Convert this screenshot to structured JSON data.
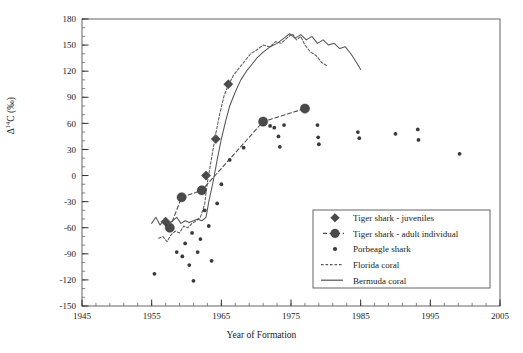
{
  "chart_data": {
    "type": "scatter",
    "title": "",
    "xlabel": "Year of Formation",
    "ylabel": "Δ¹⁴C (‰)",
    "ylabel_parts": {
      "delta": "Δ",
      "sup": "14",
      "c": "C (‰)"
    },
    "xlim": [
      1945,
      2005
    ],
    "ylim": [
      -150,
      180
    ],
    "xticks": [
      1945,
      1955,
      1965,
      1975,
      1985,
      1995,
      2005
    ],
    "xtick_labels": [
      "1945",
      "1955",
      "1965",
      "1975",
      "1985",
      "1995",
      "2005"
    ],
    "x_minor_step": 2,
    "yticks": [
      -150,
      -120,
      -90,
      -60,
      -30,
      0,
      30,
      60,
      90,
      120,
      150,
      180
    ],
    "ytick_labels": [
      "-150",
      "-120",
      "-90",
      "-60",
      "-30",
      "0",
      "30",
      "60",
      "90",
      "120",
      "150",
      "180"
    ],
    "y_minor_step": 10,
    "grid": false,
    "legend_position": "lower right",
    "series": [
      {
        "name": "Tiger shark - juveniles",
        "marker": "diamond",
        "color": "#4a4a4a",
        "line": "none",
        "points": [
          {
            "x": 1957.0,
            "y": -53
          },
          {
            "x": 1962.8,
            "y": 0
          },
          {
            "x": 1964.2,
            "y": 42
          },
          {
            "x": 1966.0,
            "y": 105
          }
        ]
      },
      {
        "name": "Tiger shark - adult individual",
        "marker": "circle",
        "color": "#4a4a4a",
        "line": "dashed",
        "points": [
          {
            "x": 1957.6,
            "y": -60
          },
          {
            "x": 1959.3,
            "y": -25
          },
          {
            "x": 1962.2,
            "y": -17
          },
          {
            "x": 1971.0,
            "y": 62
          },
          {
            "x": 1977.0,
            "y": 77
          }
        ]
      },
      {
        "name": "Porbeagle shark",
        "marker": "small-dot",
        "color": "#3a3a3a",
        "line": "none",
        "points": [
          {
            "x": 1955.4,
            "y": -113
          },
          {
            "x": 1958.6,
            "y": -88
          },
          {
            "x": 1959.4,
            "y": -93
          },
          {
            "x": 1959.8,
            "y": -78
          },
          {
            "x": 1960.4,
            "y": -103
          },
          {
            "x": 1960.8,
            "y": -66
          },
          {
            "x": 1961.0,
            "y": -121
          },
          {
            "x": 1961.6,
            "y": -88
          },
          {
            "x": 1962.0,
            "y": -73
          },
          {
            "x": 1962.6,
            "y": -40
          },
          {
            "x": 1963.2,
            "y": -58
          },
          {
            "x": 1963.6,
            "y": -98
          },
          {
            "x": 1964.4,
            "y": -32
          },
          {
            "x": 1965.0,
            "y": -10
          },
          {
            "x": 1966.2,
            "y": 18
          },
          {
            "x": 1968.2,
            "y": 32
          },
          {
            "x": 1972.0,
            "y": 57
          },
          {
            "x": 1972.6,
            "y": 55
          },
          {
            "x": 1973.2,
            "y": 45
          },
          {
            "x": 1973.4,
            "y": 33
          },
          {
            "x": 1974.0,
            "y": 58
          },
          {
            "x": 1978.8,
            "y": 58
          },
          {
            "x": 1978.9,
            "y": 44
          },
          {
            "x": 1979.0,
            "y": 36
          },
          {
            "x": 1984.6,
            "y": 50
          },
          {
            "x": 1984.8,
            "y": 43
          },
          {
            "x": 1990.0,
            "y": 48
          },
          {
            "x": 1993.2,
            "y": 53
          },
          {
            "x": 1993.3,
            "y": 41
          },
          {
            "x": 1999.2,
            "y": 25
          }
        ]
      },
      {
        "name": "Florida coral",
        "marker": "none",
        "color": "#5a5a5a",
        "line": "dashed",
        "points": [
          {
            "x": 1956.0,
            "y": -72
          },
          {
            "x": 1956.6,
            "y": -70
          },
          {
            "x": 1957.2,
            "y": -76
          },
          {
            "x": 1957.8,
            "y": -68
          },
          {
            "x": 1958.4,
            "y": -64
          },
          {
            "x": 1959.0,
            "y": -66
          },
          {
            "x": 1959.6,
            "y": -58
          },
          {
            "x": 1960.2,
            "y": -60
          },
          {
            "x": 1960.8,
            "y": -55
          },
          {
            "x": 1961.4,
            "y": -52
          },
          {
            "x": 1962.0,
            "y": -48
          },
          {
            "x": 1962.6,
            "y": -33
          },
          {
            "x": 1963.0,
            "y": -8
          },
          {
            "x": 1963.6,
            "y": 20
          },
          {
            "x": 1964.2,
            "y": 48
          },
          {
            "x": 1964.8,
            "y": 72
          },
          {
            "x": 1965.4,
            "y": 92
          },
          {
            "x": 1966.0,
            "y": 104
          },
          {
            "x": 1966.8,
            "y": 116
          },
          {
            "x": 1967.6,
            "y": 124
          },
          {
            "x": 1968.4,
            "y": 132
          },
          {
            "x": 1969.2,
            "y": 140
          },
          {
            "x": 1970.0,
            "y": 144
          },
          {
            "x": 1971.0,
            "y": 150
          },
          {
            "x": 1972.0,
            "y": 148
          },
          {
            "x": 1972.8,
            "y": 154
          },
          {
            "x": 1973.6,
            "y": 152
          },
          {
            "x": 1974.4,
            "y": 158
          },
          {
            "x": 1975.2,
            "y": 163
          },
          {
            "x": 1975.8,
            "y": 156
          },
          {
            "x": 1976.4,
            "y": 160
          },
          {
            "x": 1977.0,
            "y": 150
          },
          {
            "x": 1977.8,
            "y": 142
          },
          {
            "x": 1978.6,
            "y": 138
          },
          {
            "x": 1979.4,
            "y": 130
          },
          {
            "x": 1980.2,
            "y": 126
          }
        ]
      },
      {
        "name": "Bermuda coral",
        "marker": "none",
        "color": "#555555",
        "line": "solid",
        "points": [
          {
            "x": 1955.0,
            "y": -55
          },
          {
            "x": 1955.6,
            "y": -48
          },
          {
            "x": 1956.2,
            "y": -57
          },
          {
            "x": 1956.8,
            "y": -50
          },
          {
            "x": 1957.4,
            "y": -56
          },
          {
            "x": 1958.0,
            "y": -52
          },
          {
            "x": 1958.6,
            "y": -48
          },
          {
            "x": 1959.2,
            "y": -55
          },
          {
            "x": 1959.8,
            "y": -52
          },
          {
            "x": 1960.4,
            "y": -54
          },
          {
            "x": 1961.0,
            "y": -52
          },
          {
            "x": 1961.6,
            "y": -50
          },
          {
            "x": 1962.2,
            "y": -52
          },
          {
            "x": 1962.8,
            "y": -48
          },
          {
            "x": 1963.2,
            "y": -30
          },
          {
            "x": 1963.8,
            "y": -8
          },
          {
            "x": 1964.4,
            "y": 18
          },
          {
            "x": 1965.0,
            "y": 42
          },
          {
            "x": 1965.6,
            "y": 62
          },
          {
            "x": 1966.2,
            "y": 80
          },
          {
            "x": 1967.0,
            "y": 96
          },
          {
            "x": 1967.8,
            "y": 110
          },
          {
            "x": 1968.6,
            "y": 120
          },
          {
            "x": 1969.4,
            "y": 128
          },
          {
            "x": 1970.2,
            "y": 136
          },
          {
            "x": 1971.0,
            "y": 142
          },
          {
            "x": 1972.0,
            "y": 148
          },
          {
            "x": 1973.0,
            "y": 152
          },
          {
            "x": 1974.0,
            "y": 158
          },
          {
            "x": 1974.8,
            "y": 163
          },
          {
            "x": 1975.6,
            "y": 158
          },
          {
            "x": 1976.4,
            "y": 162
          },
          {
            "x": 1977.2,
            "y": 156
          },
          {
            "x": 1978.0,
            "y": 160
          },
          {
            "x": 1978.8,
            "y": 152
          },
          {
            "x": 1979.6,
            "y": 156
          },
          {
            "x": 1980.4,
            "y": 150
          },
          {
            "x": 1981.2,
            "y": 152
          },
          {
            "x": 1982.0,
            "y": 146
          },
          {
            "x": 1982.8,
            "y": 148
          },
          {
            "x": 1983.6,
            "y": 140
          },
          {
            "x": 1984.4,
            "y": 130
          },
          {
            "x": 1985.0,
            "y": 122
          }
        ]
      }
    ],
    "legend": [
      {
        "label": "Tiger shark - juveniles",
        "marker": "diamond",
        "line": "none"
      },
      {
        "label": "Tiger shark - adult individual",
        "marker": "circle",
        "line": "dashed"
      },
      {
        "label": "Porbeagle shark",
        "marker": "small-dot",
        "line": "none"
      },
      {
        "label": "Florida coral",
        "marker": "none",
        "line": "dashed"
      },
      {
        "label": "Bermuda coral",
        "marker": "none",
        "line": "solid"
      }
    ]
  }
}
